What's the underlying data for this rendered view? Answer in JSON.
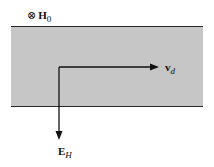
{
  "diagram": {
    "field_label": {
      "symbol": "⊗",
      "main": "H",
      "subscript": "0"
    },
    "velocity_label": {
      "main": "v",
      "subscript": "d"
    },
    "hall_field_label": {
      "main": "E",
      "subscript": "H"
    },
    "colors": {
      "band_fill": "#c6c6c6",
      "lines": "#111111"
    }
  }
}
